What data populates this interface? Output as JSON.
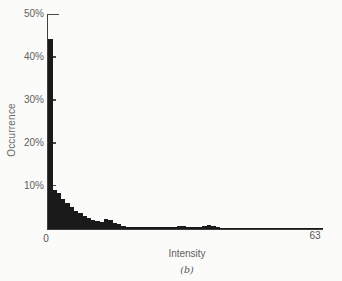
{
  "figure": {
    "ylabel": "Occurrence",
    "xlabel": "Intensity",
    "caption": "(b)",
    "x_start_label": "0",
    "x_end_label": "63",
    "ytick_labels": [
      "50%",
      "40%",
      "30%",
      "20%",
      "10%"
    ]
  },
  "chart_data": {
    "type": "bar",
    "title": "",
    "xlabel": "Intensity",
    "ylabel": "Occurrence",
    "x_range": [
      0,
      63
    ],
    "ylim_percent": [
      0,
      50
    ],
    "yticks_percent": [
      10,
      20,
      30,
      40,
      50
    ],
    "grid": false,
    "legend": "none",
    "bar_color": "#1a1a1a",
    "values_percent": [
      44.5,
      9.3,
      8.4,
      7.2,
      6.1,
      5.2,
      4.4,
      3.8,
      3.2,
      2.7,
      2.3,
      2.0,
      1.8,
      2.4,
      2.2,
      1.5,
      1.3,
      0.8,
      0.6,
      0.6,
      0.5,
      0.5,
      0.5,
      0.5,
      0.5,
      0.5,
      0.5,
      0.5,
      0.5,
      0.5,
      0.8,
      0.7,
      0.5,
      0.5,
      0.5,
      0.5,
      0.9,
      1.0,
      0.8,
      0.5,
      0.4,
      0.4,
      0.4,
      0.4,
      0.4,
      0.4,
      0.4,
      0.4,
      0.4,
      0.4,
      0.4,
      0.4,
      0.4,
      0.4,
      0.4,
      0.4,
      0.4,
      0.4,
      0.4,
      0.4,
      0.4,
      0.4,
      0.4,
      0.4
    ]
  },
  "colors": {
    "background": "#fbfbf9",
    "axis": "#3f3f3f",
    "text": "#5c5c5c",
    "bars": "#1a1a1a"
  }
}
